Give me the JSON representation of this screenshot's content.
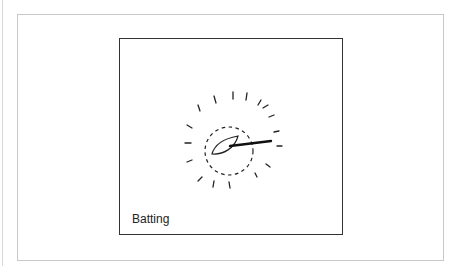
{
  "figure": {
    "caption": "Batting",
    "icon": "batting-icon",
    "colors": {
      "stroke": "#222222",
      "frame": "#c8c8c8",
      "panel_border": "#333333"
    }
  }
}
